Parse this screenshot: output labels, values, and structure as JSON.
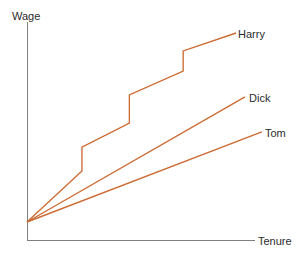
{
  "chart_data": {
    "type": "line",
    "title": "",
    "subtitle": "",
    "xlabel": "Tenure",
    "ylabel": "Wage",
    "xlim": [
      0,
      1
    ],
    "ylim": [
      0,
      1
    ],
    "grid": false,
    "legend_position": "end-of-line",
    "axis_ticks": false,
    "tick_labels_x": [],
    "tick_labels_y": [],
    "series": [
      {
        "name": "Harry",
        "color": "#CC6B33",
        "shape": "step-rising",
        "description": "Rising wage profile with three discrete upward jumps (promotions); steepest overall growth.",
        "points": [
          [
            0.0,
            0.0
          ],
          [
            0.241,
            0.236
          ],
          [
            0.241,
            0.347
          ],
          [
            0.449,
            0.458
          ],
          [
            0.449,
            0.588
          ],
          [
            0.685,
            0.699
          ],
          [
            0.685,
            0.792
          ],
          [
            0.917,
            0.875
          ]
        ]
      },
      {
        "name": "Dick",
        "color": "#CC6B33",
        "shape": "linear",
        "description": "Straight-line wage profile, intermediate slope, no jumps.",
        "points": [
          [
            0.0,
            0.0
          ],
          [
            0.956,
            0.579
          ]
        ]
      },
      {
        "name": "Tom",
        "color": "#CC6B33",
        "shape": "linear",
        "description": "Straight-line wage profile, flattest slope, no jumps.",
        "points": [
          [
            0.0,
            0.0
          ],
          [
            1.03,
            0.417
          ]
        ]
      }
    ],
    "axis_color": "#808080",
    "line_color": "#CC6B33",
    "text_color": "#2b2b2b",
    "background": "#ffffff"
  },
  "axes": {
    "y_axis_label": "Wage",
    "x_axis_label": "Tenure"
  },
  "series_labels": {
    "harry": "Harry",
    "dick": "Dick",
    "tom": "Tom"
  },
  "geometry": {
    "origin": {
      "x": 27,
      "y": 222
    },
    "y_axis_top": 22,
    "x_axis_right": 255,
    "axis_corner_y": 240
  }
}
